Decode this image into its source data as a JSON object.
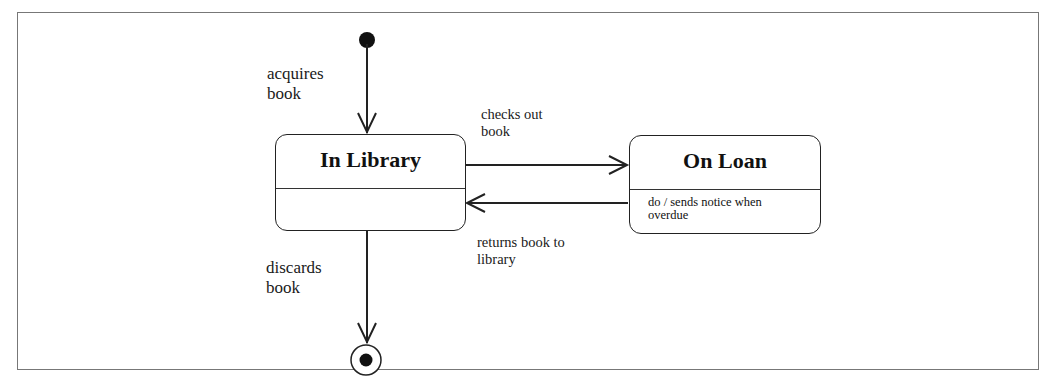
{
  "diagram": {
    "type": "UML state machine diagram",
    "initial_state": {
      "kind": "initial-pseudostate"
    },
    "final_state": {
      "kind": "final-state"
    },
    "states": [
      {
        "name": "In Library",
        "activity": ""
      },
      {
        "name": "On Loan",
        "activity": "do / sends notice when\noverdue"
      }
    ],
    "transitions": [
      {
        "from": "initial",
        "to": "In Library",
        "label": "acquires\nbook"
      },
      {
        "from": "In Library",
        "to": "On Loan",
        "label": "checks out\nbook"
      },
      {
        "from": "On Loan",
        "to": "In Library",
        "label": "returns book to\nlibrary"
      },
      {
        "from": "In Library",
        "to": "final",
        "label": "discards\nbook"
      }
    ],
    "colors": {
      "line": "#222222",
      "frame": "#777777",
      "background": "#ffffff"
    }
  }
}
